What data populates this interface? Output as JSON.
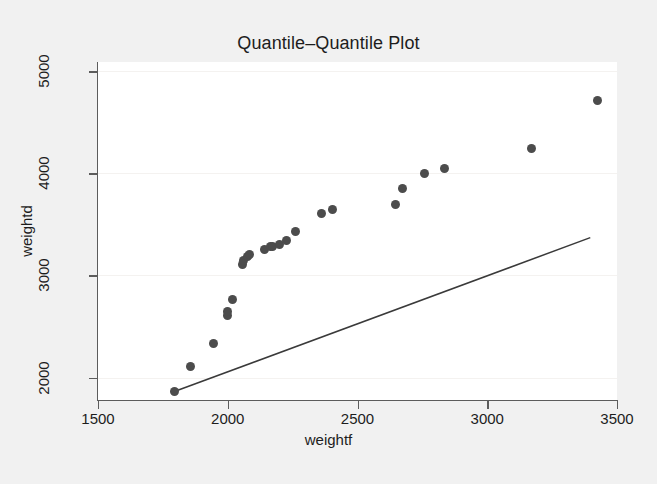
{
  "chart_data": {
    "type": "scatter",
    "title": "Quantile–Quantile Plot",
    "xlabel": "weightf",
    "ylabel": "weightd",
    "xlim": [
      1500,
      3500
    ],
    "ylim": [
      1780,
      5090
    ],
    "xticks": [
      1500,
      2000,
      2500,
      3000,
      3500
    ],
    "xtick_labels": [
      "1500",
      "2000",
      "2500",
      "3000",
      "3500"
    ],
    "yticks": [
      2000,
      3000,
      4000,
      5000
    ],
    "ytick_labels": [
      "2000",
      "3000",
      "4000",
      "5000"
    ],
    "grid": true,
    "grid_axis": "y",
    "legend": "none",
    "marker_color": "#4c4c4c",
    "marker_shape": "circle",
    "line_color": "#3a3a3a",
    "background_color": "#f1f1f1",
    "plot_background_color": "#ffffff",
    "axis_color": "#5c5c5c",
    "series": [
      {
        "name": "quantile-points",
        "type": "scatter",
        "points": [
          [
            1795,
            1868
          ],
          [
            1855,
            2108
          ],
          [
            1945,
            2330
          ],
          [
            1998,
            2612
          ],
          [
            2000,
            2648
          ],
          [
            2020,
            2765
          ],
          [
            2058,
            3110
          ],
          [
            2062,
            3150
          ],
          [
            2075,
            3188
          ],
          [
            2085,
            3200
          ],
          [
            2140,
            3255
          ],
          [
            2165,
            3285
          ],
          [
            2172,
            3288
          ],
          [
            2198,
            3300
          ],
          [
            2228,
            3340
          ],
          [
            2262,
            3430
          ],
          [
            2360,
            3610
          ],
          [
            2405,
            3650
          ],
          [
            2645,
            3690
          ],
          [
            2672,
            3850
          ],
          [
            2760,
            4000
          ],
          [
            2835,
            4045
          ],
          [
            3170,
            4245
          ],
          [
            3425,
            4715
          ]
        ]
      },
      {
        "name": "reference-line",
        "type": "line",
        "points": [
          [
            1797,
            1865
          ],
          [
            3397,
            3370
          ]
        ]
      }
    ]
  },
  "figure": {
    "title": "Quantile–Quantile Plot",
    "x_axis_title": "weightf",
    "y_axis_title": "weightd"
  }
}
